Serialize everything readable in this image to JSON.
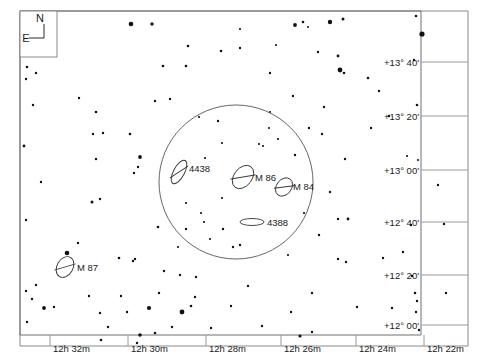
{
  "chart_title": "Virgo Cluster Star Chart — Markarian's Chain Field",
  "compass": {
    "north_label": "N",
    "east_label": "E"
  },
  "axes": {
    "dec_label_suffix": "'",
    "dec_ticks": [
      {
        "label": "+13° 40'",
        "y": 62
      },
      {
        "label": "+13° 20'",
        "y": 116
      },
      {
        "label": "+13° 00'",
        "y": 170
      },
      {
        "label": "+12° 40'",
        "y": 222
      },
      {
        "label": "+12° 20'",
        "y": 275
      },
      {
        "label": "+12° 00'",
        "y": 325
      }
    ],
    "ra_ticks": [
      {
        "label": "12h 32m",
        "x": 50
      },
      {
        "label": "12h 30m",
        "x": 128
      },
      {
        "label": "12h 28m",
        "x": 206
      },
      {
        "label": "12h 26m",
        "x": 281
      },
      {
        "label": "12h 24m",
        "x": 356
      },
      {
        "label": "12h 22m",
        "x": 424
      }
    ]
  },
  "fov_circle": {
    "cx": 236,
    "cy": 182,
    "r": 77
  },
  "galaxies": [
    {
      "name": "4438",
      "cx": 179,
      "cy": 172,
      "rx": 5.5,
      "ry": 13,
      "angle": 28,
      "label_x": 189,
      "label_y": 172,
      "bar": true
    },
    {
      "name": "M 86",
      "cx": 243,
      "cy": 177,
      "rx": 9,
      "ry": 13,
      "angle": 38,
      "label_x": 255,
      "label_y": 181,
      "bar": true
    },
    {
      "name": "M 84",
      "cx": 284,
      "cy": 187,
      "rx": 7.5,
      "ry": 10,
      "angle": 38,
      "label_x": 293,
      "label_y": 190,
      "bar": true
    },
    {
      "name": "4388",
      "cx": 252,
      "cy": 222,
      "rx": 12,
      "ry": 3.5,
      "angle": 0,
      "label_x": 267,
      "label_y": 226,
      "bar": false
    },
    {
      "name": "M 87",
      "cx": 65,
      "cy": 267,
      "rx": 8,
      "ry": 11,
      "angle": 30,
      "label_x": 77,
      "label_y": 271,
      "bar": true
    }
  ],
  "stars": [
    {
      "x": 131,
      "y": 24,
      "r": 2.3
    },
    {
      "x": 152,
      "y": 24,
      "r": 1.7
    },
    {
      "x": 188,
      "y": 46,
      "r": 1.3
    },
    {
      "x": 240,
      "y": 48,
      "r": 1.2
    },
    {
      "x": 330,
      "y": 22,
      "r": 2.2
    },
    {
      "x": 343,
      "y": 19,
      "r": 1.5
    },
    {
      "x": 422,
      "y": 34,
      "r": 2.6
    },
    {
      "x": 416,
      "y": 16,
      "r": 1.3
    },
    {
      "x": 414,
      "y": 60,
      "r": 1.2
    },
    {
      "x": 417,
      "y": 105,
      "r": 1.3
    },
    {
      "x": 240,
      "y": 29,
      "r": 1.1
    },
    {
      "x": 308,
      "y": 27,
      "r": 1.0
    },
    {
      "x": 27,
      "y": 67,
      "r": 1.3
    },
    {
      "x": 26,
      "y": 79,
      "r": 1.2
    },
    {
      "x": 36,
      "y": 73,
      "r": 1.2
    },
    {
      "x": 24,
      "y": 146,
      "r": 1.4
    },
    {
      "x": 33,
      "y": 105,
      "r": 1.2
    },
    {
      "x": 79,
      "y": 98,
      "r": 1.2
    },
    {
      "x": 96,
      "y": 112,
      "r": 1.3
    },
    {
      "x": 93,
      "y": 134,
      "r": 1.2
    },
    {
      "x": 103,
      "y": 133,
      "r": 1.2
    },
    {
      "x": 130,
      "y": 134,
      "r": 1.3
    },
    {
      "x": 140,
      "y": 157,
      "r": 1.9
    },
    {
      "x": 138,
      "y": 167,
      "r": 1.2
    },
    {
      "x": 134,
      "y": 173,
      "r": 1.2
    },
    {
      "x": 155,
      "y": 101,
      "r": 1.2
    },
    {
      "x": 163,
      "y": 66,
      "r": 1.3
    },
    {
      "x": 170,
      "y": 99,
      "r": 1.2
    },
    {
      "x": 186,
      "y": 66,
      "r": 1.3
    },
    {
      "x": 218,
      "y": 121,
      "r": 1.2
    },
    {
      "x": 96,
      "y": 159,
      "r": 1.2
    },
    {
      "x": 221,
      "y": 51,
      "r": 1.3
    },
    {
      "x": 295,
      "y": 25,
      "r": 1.9
    },
    {
      "x": 303,
      "y": 22,
      "r": 1.3
    },
    {
      "x": 276,
      "y": 45,
      "r": 1.1
    },
    {
      "x": 318,
      "y": 52,
      "r": 1.2
    },
    {
      "x": 338,
      "y": 56,
      "r": 1.4
    },
    {
      "x": 340,
      "y": 70,
      "r": 2.4
    },
    {
      "x": 344,
      "y": 73,
      "r": 1.3
    },
    {
      "x": 368,
      "y": 78,
      "r": 1.3
    },
    {
      "x": 379,
      "y": 91,
      "r": 1.2
    },
    {
      "x": 293,
      "y": 96,
      "r": 1.2
    },
    {
      "x": 324,
      "y": 107,
      "r": 1.2
    },
    {
      "x": 270,
      "y": 73,
      "r": 1.2
    },
    {
      "x": 322,
      "y": 134,
      "r": 1.2
    },
    {
      "x": 269,
      "y": 128,
      "r": 1.1
    },
    {
      "x": 309,
      "y": 128,
      "r": 1.2
    },
    {
      "x": 371,
      "y": 128,
      "r": 1.2
    },
    {
      "x": 389,
      "y": 116,
      "r": 1.2
    },
    {
      "x": 295,
      "y": 155,
      "r": 1.2
    },
    {
      "x": 345,
      "y": 159,
      "r": 1.2
    },
    {
      "x": 418,
      "y": 160,
      "r": 1.1
    },
    {
      "x": 407,
      "y": 156,
      "r": 1.1
    },
    {
      "x": 222,
      "y": 143,
      "r": 1.1
    },
    {
      "x": 199,
      "y": 117,
      "r": 1.1
    },
    {
      "x": 270,
      "y": 112,
      "r": 1.1
    },
    {
      "x": 204,
      "y": 222,
      "r": 1.1
    },
    {
      "x": 210,
      "y": 239,
      "r": 1.1
    },
    {
      "x": 240,
      "y": 245,
      "r": 1.2
    },
    {
      "x": 263,
      "y": 146,
      "r": 1.1
    },
    {
      "x": 304,
      "y": 213,
      "r": 1.1
    },
    {
      "x": 222,
      "y": 198,
      "r": 1.1
    },
    {
      "x": 186,
      "y": 203,
      "r": 1.1
    },
    {
      "x": 92,
      "y": 202,
      "r": 1.5
    },
    {
      "x": 100,
      "y": 199,
      "r": 1.2
    },
    {
      "x": 41,
      "y": 182,
      "r": 1.2
    },
    {
      "x": 26,
      "y": 220,
      "r": 1.2
    },
    {
      "x": 67,
      "y": 253,
      "r": 2.3
    },
    {
      "x": 78,
      "y": 243,
      "r": 1.2
    },
    {
      "x": 158,
      "y": 227,
      "r": 1.3
    },
    {
      "x": 186,
      "y": 229,
      "r": 1.2
    },
    {
      "x": 223,
      "y": 229,
      "r": 1.2
    },
    {
      "x": 135,
      "y": 259,
      "r": 1.2
    },
    {
      "x": 119,
      "y": 258,
      "r": 1.3
    },
    {
      "x": 133,
      "y": 261,
      "r": 1.2
    },
    {
      "x": 164,
      "y": 271,
      "r": 1.2
    },
    {
      "x": 159,
      "y": 293,
      "r": 1.2
    },
    {
      "x": 195,
      "y": 297,
      "r": 1.2
    },
    {
      "x": 36,
      "y": 285,
      "r": 1.2
    },
    {
      "x": 26,
      "y": 291,
      "r": 1.2
    },
    {
      "x": 32,
      "y": 299,
      "r": 1.2
    },
    {
      "x": 27,
      "y": 322,
      "r": 1.2
    },
    {
      "x": 44,
      "y": 308,
      "r": 1.9
    },
    {
      "x": 54,
      "y": 307,
      "r": 1.2
    },
    {
      "x": 89,
      "y": 296,
      "r": 1.2
    },
    {
      "x": 100,
      "y": 313,
      "r": 1.2
    },
    {
      "x": 121,
      "y": 296,
      "r": 1.2
    },
    {
      "x": 127,
      "y": 312,
      "r": 1.2
    },
    {
      "x": 149,
      "y": 308,
      "r": 2.1
    },
    {
      "x": 182,
      "y": 312,
      "r": 2.4
    },
    {
      "x": 191,
      "y": 306,
      "r": 1.3
    },
    {
      "x": 196,
      "y": 277,
      "r": 1.2
    },
    {
      "x": 180,
      "y": 275,
      "r": 1.2
    },
    {
      "x": 155,
      "y": 333,
      "r": 1.3
    },
    {
      "x": 172,
      "y": 327,
      "r": 1.2
    },
    {
      "x": 137,
      "y": 343,
      "r": 1.2
    },
    {
      "x": 101,
      "y": 340,
      "r": 1.3
    },
    {
      "x": 330,
      "y": 192,
      "r": 1.2
    },
    {
      "x": 338,
      "y": 219,
      "r": 1.2
    },
    {
      "x": 348,
      "y": 219,
      "r": 1.4
    },
    {
      "x": 319,
      "y": 235,
      "r": 1.2
    },
    {
      "x": 338,
      "y": 259,
      "r": 1.2
    },
    {
      "x": 346,
      "y": 262,
      "r": 1.2
    },
    {
      "x": 383,
      "y": 258,
      "r": 1.2
    },
    {
      "x": 403,
      "y": 252,
      "r": 1.2
    },
    {
      "x": 411,
      "y": 225,
      "r": 1.2
    },
    {
      "x": 444,
      "y": 224,
      "r": 1.2
    },
    {
      "x": 412,
      "y": 276,
      "r": 1.2
    },
    {
      "x": 416,
      "y": 312,
      "r": 1.2
    },
    {
      "x": 417,
      "y": 301,
      "r": 1.2
    },
    {
      "x": 415,
      "y": 293,
      "r": 1.3
    },
    {
      "x": 392,
      "y": 308,
      "r": 1.2
    },
    {
      "x": 419,
      "y": 330,
      "r": 1.2
    },
    {
      "x": 357,
      "y": 307,
      "r": 1.2
    },
    {
      "x": 446,
      "y": 293,
      "r": 1.2
    },
    {
      "x": 438,
      "y": 185,
      "r": 1.2
    },
    {
      "x": 312,
      "y": 293,
      "r": 1.2
    },
    {
      "x": 248,
      "y": 286,
      "r": 1.2
    },
    {
      "x": 262,
      "y": 326,
      "r": 1.2
    },
    {
      "x": 291,
      "y": 312,
      "r": 1.2
    },
    {
      "x": 231,
      "y": 306,
      "r": 1.2
    },
    {
      "x": 211,
      "y": 328,
      "r": 1.2
    },
    {
      "x": 300,
      "y": 336,
      "r": 1.6
    },
    {
      "x": 312,
      "y": 332,
      "r": 1.2
    },
    {
      "x": 140,
      "y": 335,
      "r": 1.8
    },
    {
      "x": 108,
      "y": 327,
      "r": 1.2
    },
    {
      "x": 247,
      "y": 181,
      "r": 0.0
    },
    {
      "x": 201,
      "y": 213,
      "r": 1.1
    },
    {
      "x": 288,
      "y": 255,
      "r": 1.1
    },
    {
      "x": 178,
      "y": 247,
      "r": 1.1
    },
    {
      "x": 259,
      "y": 144,
      "r": 1.1
    },
    {
      "x": 233,
      "y": 247,
      "r": 1.2
    },
    {
      "x": 278,
      "y": 139,
      "r": 1.1
    },
    {
      "x": 205,
      "y": 158,
      "r": 1.1
    }
  ]
}
